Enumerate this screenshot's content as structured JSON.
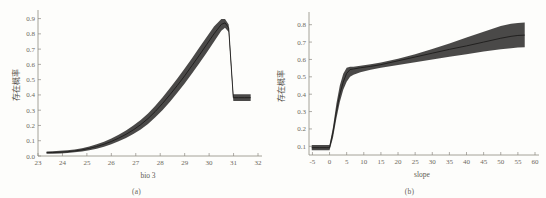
{
  "figure": {
    "background_color": "#fdfdfb",
    "band_color": "#3b3a38",
    "line_color": "#1d1c1b",
    "axis_color": "#8e8a82"
  },
  "panels": [
    {
      "caption": "(a)",
      "ylabel": "存在概率",
      "xlabel": "bio 3"
    },
    {
      "caption": "(b)",
      "ylabel": "存在概率",
      "xlabel": "slope"
    }
  ],
  "chart_data": [
    {
      "type": "area",
      "title": "",
      "subtitle": "",
      "panel": "(a)",
      "xlabel": "bio 3",
      "ylabel": "存在概率",
      "xlim": [
        23,
        32
      ],
      "ylim": [
        0.0,
        0.93
      ],
      "xticks": [
        23,
        24,
        25,
        26,
        27,
        28,
        29,
        30,
        31,
        32
      ],
      "yticks": [
        0.0,
        0.1,
        0.2,
        0.3,
        0.4,
        0.5,
        0.6,
        0.7,
        0.8,
        0.9
      ],
      "xtick_labels": [
        "23",
        "24",
        "25",
        "26",
        "27",
        "28",
        "29",
        "30",
        "31",
        "32"
      ],
      "ytick_labels": [
        "0.0",
        "0.1",
        "0.2",
        "0.3",
        "0.4",
        "0.5",
        "0.6",
        "0.7",
        "0.8",
        "0.9"
      ],
      "grid": false,
      "legend": "none",
      "series": [
        {
          "name": "存在概率 (mean)",
          "x": [
            23.35,
            23.6,
            23.9,
            24.2,
            24.5,
            24.8,
            25.1,
            25.4,
            25.7,
            26.0,
            26.3,
            26.6,
            26.9,
            27.2,
            27.5,
            27.8,
            28.1,
            28.4,
            28.7,
            29.0,
            29.3,
            29.6,
            29.9,
            30.2,
            30.5,
            30.65,
            30.8,
            30.99,
            31.0,
            31.2,
            31.45,
            31.7
          ],
          "values": [
            0.022,
            0.023,
            0.025,
            0.028,
            0.033,
            0.04,
            0.05,
            0.062,
            0.077,
            0.095,
            0.117,
            0.142,
            0.171,
            0.205,
            0.245,
            0.292,
            0.345,
            0.402,
            0.462,
            0.525,
            0.592,
            0.66,
            0.73,
            0.8,
            0.862,
            0.872,
            0.84,
            0.382,
            0.382,
            0.382,
            0.382,
            0.382
          ]
        },
        {
          "name": "存在概率 (lower bound)",
          "x": [
            23.35,
            23.6,
            23.9,
            24.2,
            24.5,
            24.8,
            25.1,
            25.4,
            25.7,
            26.0,
            26.3,
            26.6,
            26.9,
            27.2,
            27.5,
            27.8,
            28.1,
            28.4,
            28.7,
            29.0,
            29.3,
            29.6,
            29.9,
            30.2,
            30.5,
            30.65,
            30.8,
            30.99,
            31.0,
            31.2,
            31.45,
            31.7
          ],
          "values": [
            0.014,
            0.015,
            0.017,
            0.02,
            0.024,
            0.03,
            0.038,
            0.048,
            0.061,
            0.077,
            0.096,
            0.118,
            0.144,
            0.174,
            0.21,
            0.253,
            0.302,
            0.356,
            0.414,
            0.475,
            0.54,
            0.607,
            0.676,
            0.748,
            0.82,
            0.84,
            0.812,
            0.36,
            0.36,
            0.36,
            0.36,
            0.36
          ]
        },
        {
          "name": "存在概率 (upper bound)",
          "x": [
            23.35,
            23.6,
            23.9,
            24.2,
            24.5,
            24.8,
            25.1,
            25.4,
            25.7,
            26.0,
            26.3,
            26.6,
            26.9,
            27.2,
            27.5,
            27.8,
            28.1,
            28.4,
            28.7,
            29.0,
            29.3,
            29.6,
            29.9,
            30.2,
            30.5,
            30.65,
            30.8,
            30.99,
            31.0,
            31.2,
            31.45,
            31.7
          ],
          "values": [
            0.03,
            0.031,
            0.034,
            0.037,
            0.043,
            0.051,
            0.063,
            0.077,
            0.094,
            0.114,
            0.139,
            0.167,
            0.199,
            0.236,
            0.279,
            0.329,
            0.385,
            0.445,
            0.508,
            0.573,
            0.641,
            0.71,
            0.78,
            0.848,
            0.898,
            0.898,
            0.862,
            0.404,
            0.404,
            0.404,
            0.404,
            0.404
          ]
        }
      ]
    },
    {
      "type": "area",
      "title": "",
      "subtitle": "",
      "panel": "(b)",
      "xlabel": "slope",
      "ylabel": "存在概率",
      "xlim": [
        -6,
        60
      ],
      "ylim": [
        0.05,
        0.85
      ],
      "xticks": [
        -5,
        0,
        5,
        10,
        15,
        20,
        25,
        30,
        35,
        40,
        45,
        50,
        55,
        60
      ],
      "yticks": [
        0.1,
        0.2,
        0.3,
        0.4,
        0.5,
        0.6,
        0.7,
        0.8
      ],
      "xtick_labels": [
        "-5",
        "0",
        "5",
        "10",
        "15",
        "20",
        "25",
        "30",
        "35",
        "40",
        "45",
        "50",
        "55",
        "60"
      ],
      "ytick_labels": [
        "0.1",
        "0.2",
        "0.3",
        "0.4",
        "0.5",
        "0.6",
        "0.7",
        "0.8"
      ],
      "grid": false,
      "legend": "none",
      "series": [
        {
          "name": "存在概率 (mean)",
          "x": [
            -5.2,
            -3.0,
            -1.0,
            0.0,
            1.0,
            2.0,
            3.0,
            4.0,
            5.0,
            6.0,
            7.0,
            9.0,
            12.0,
            15.0,
            20.0,
            25.0,
            30.0,
            35.0,
            40.0,
            45.0,
            50.0,
            53.0,
            55.0,
            57.0
          ],
          "values": [
            0.092,
            0.092,
            0.092,
            0.092,
            0.18,
            0.3,
            0.4,
            0.47,
            0.52,
            0.542,
            0.545,
            0.552,
            0.56,
            0.57,
            0.592,
            0.614,
            0.636,
            0.658,
            0.678,
            0.7,
            0.722,
            0.733,
            0.738,
            0.74
          ]
        },
        {
          "name": "存在概率 (lower bound)",
          "x": [
            -5.2,
            -3.0,
            -1.0,
            0.0,
            1.0,
            2.0,
            3.0,
            4.0,
            5.0,
            6.0,
            7.0,
            9.0,
            12.0,
            15.0,
            20.0,
            25.0,
            30.0,
            35.0,
            40.0,
            45.0,
            50.0,
            53.0,
            55.0,
            57.0
          ],
          "values": [
            0.078,
            0.078,
            0.078,
            0.078,
            0.15,
            0.26,
            0.355,
            0.425,
            0.472,
            0.5,
            0.512,
            0.526,
            0.54,
            0.552,
            0.568,
            0.584,
            0.6,
            0.616,
            0.63,
            0.645,
            0.658,
            0.665,
            0.668,
            0.67
          ]
        },
        {
          "name": "存在概率 (upper bound)",
          "x": [
            -5.2,
            -3.0,
            -1.0,
            0.0,
            1.0,
            2.0,
            3.0,
            4.0,
            5.0,
            6.0,
            7.0,
            9.0,
            12.0,
            15.0,
            20.0,
            25.0,
            30.0,
            35.0,
            40.0,
            45.0,
            50.0,
            53.0,
            55.0,
            57.0
          ],
          "values": [
            0.108,
            0.108,
            0.108,
            0.108,
            0.21,
            0.345,
            0.45,
            0.518,
            0.552,
            0.558,
            0.558,
            0.563,
            0.572,
            0.582,
            0.604,
            0.63,
            0.66,
            0.692,
            0.726,
            0.76,
            0.792,
            0.806,
            0.81,
            0.812
          ]
        }
      ]
    }
  ]
}
